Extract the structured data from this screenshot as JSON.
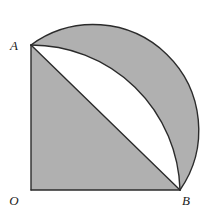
{
  "figure": {
    "background_color": "#ffffff",
    "shaded_color": "#b0b0b0",
    "unshaded_color": "#ffffff",
    "stroke_color": "#2b2b2b",
    "stroke_width": 1.4,
    "labels": [
      {
        "id": "A",
        "text": "A",
        "x": 14,
        "y": 50
      },
      {
        "id": "O",
        "text": "O",
        "x": 11,
        "y": 205
      },
      {
        "id": "B",
        "text": "B",
        "x": 182,
        "y": 205
      }
    ],
    "points": {
      "O": {
        "x": 31,
        "y": 190
      },
      "A": {
        "x": 31,
        "y": 45
      },
      "B": {
        "x": 180,
        "y": 190
      },
      "C": {
        "x": 180,
        "y": 45
      }
    },
    "geometry": {
      "square_side": 149,
      "quarter_arc": {
        "center": "O",
        "radius": 149,
        "from": "A",
        "to": "B",
        "sweep": "clockwise-through-top-right"
      },
      "inner_arc": {
        "type": "semicircle",
        "diameter_endpoints": [
          "A",
          "B"
        ],
        "center": {
          "x": 105.5,
          "y": 117.5
        },
        "radius": 105.4,
        "bulge": "up-right"
      },
      "chord": {
        "from": "A",
        "to": "B"
      }
    },
    "regions": [
      {
        "id": "shaded-square-lower-left",
        "fill": "shaded"
      },
      {
        "id": "shaded-outer-crescent",
        "fill": "shaded"
      },
      {
        "id": "white-lens",
        "fill": "unshaded"
      }
    ]
  }
}
